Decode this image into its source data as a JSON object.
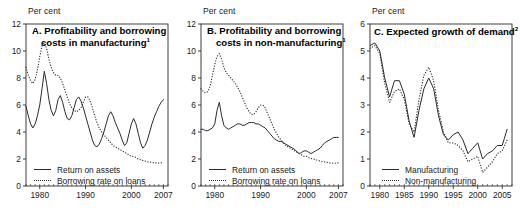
{
  "figure": {
    "unit_label": "Per cent",
    "background": "#ffffff",
    "line_color": "#2b2b2b"
  },
  "panels": [
    {
      "id": "A",
      "title_line1": "A. Profitability and borrowing",
      "title_line2": "costs in manufacturing",
      "title_superscript": "1",
      "unit_label": "Per cent",
      "legend": [
        {
          "label": "Return on assets",
          "style": "solid"
        },
        {
          "label": "Borrowing rate on loans",
          "style": "dotted"
        }
      ],
      "y_ticks": [
        "0",
        "2",
        "4",
        "6",
        "8",
        "10",
        "12"
      ],
      "x_ticks": [
        "1980",
        "1990",
        "2000",
        "2007"
      ]
    },
    {
      "id": "B",
      "title_line1": "B. Profitability and borrowing",
      "title_line2": "costs in non-manufacturing",
      "title_superscript": "1",
      "unit_label": "Per cent",
      "legend": [
        {
          "label": "Return on assets",
          "style": "solid"
        },
        {
          "label": "Borrowing rate on loans",
          "style": "dotted"
        }
      ],
      "y_ticks": [
        "0",
        "2",
        "4",
        "6",
        "8",
        "10",
        "12"
      ],
      "x_ticks": [
        "1980",
        "1990",
        "2000",
        "2007"
      ]
    },
    {
      "id": "C",
      "title_line1": "C. Expected growth of demand",
      "title_line2": "",
      "title_superscript": "2",
      "unit_label": "Per cent",
      "legend": [
        {
          "label": "Manufacturing",
          "style": "solid"
        },
        {
          "label": "Non-manufacturing",
          "style": "dotted"
        }
      ],
      "y_ticks": [
        "0",
        "1",
        "2",
        "3",
        "4",
        "5",
        "6"
      ],
      "x_ticks": [
        "1980",
        "1985",
        "1990",
        "1995",
        "2000",
        "2005"
      ]
    }
  ],
  "chart_data": [
    {
      "type": "line",
      "panel": "A",
      "title": "A. Profitability and borrowing costs in manufacturing",
      "xlabel": "",
      "ylabel": "Per cent",
      "xlim": [
        1977,
        2008
      ],
      "ylim": [
        0,
        12
      ],
      "ytick_step": 2,
      "xticks": [
        1980,
        1990,
        2000,
        2007
      ],
      "grid": false,
      "legend_position": "bottom-left",
      "series": [
        {
          "name": "Return on assets",
          "style": "solid",
          "x": [
            1977,
            1977.5,
            1978,
            1978.5,
            1979,
            1979.5,
            1980,
            1980.5,
            1981,
            1981.5,
            1982,
            1982.5,
            1983,
            1983.5,
            1984,
            1984.5,
            1985,
            1985.5,
            1986,
            1986.5,
            1987,
            1987.5,
            1988,
            1988.5,
            1989,
            1989.5,
            1990,
            1990.5,
            1991,
            1991.5,
            1992,
            1992.5,
            1993,
            1993.5,
            1994,
            1994.5,
            1995,
            1995.5,
            1996,
            1996.5,
            1997,
            1997.5,
            1998,
            1998.5,
            1999,
            1999.5,
            2000,
            2000.5,
            2001,
            2001.5,
            2002,
            2002.5,
            2003,
            2003.5,
            2004,
            2004.5,
            2005,
            2005.5,
            2006,
            2006.5,
            2007
          ],
          "y": [
            5.9,
            5.2,
            4.6,
            4.3,
            4.6,
            5.2,
            6.0,
            7.2,
            8.5,
            7.6,
            6.4,
            5.6,
            5.2,
            5.6,
            6.4,
            6.7,
            6.2,
            5.5,
            5.0,
            4.9,
            5.2,
            5.8,
            6.4,
            6.6,
            6.3,
            5.8,
            5.2,
            4.6,
            4.0,
            3.4,
            3.0,
            2.9,
            3.1,
            3.5,
            4.0,
            4.6,
            5.2,
            5.5,
            5.2,
            4.7,
            4.3,
            3.9,
            3.4,
            3.0,
            3.2,
            3.9,
            4.6,
            5.0,
            4.6,
            3.9,
            3.2,
            2.8,
            3.0,
            3.4,
            4.0,
            4.6,
            5.1,
            5.5,
            5.9,
            6.2,
            6.4
          ]
        },
        {
          "name": "Borrowing rate on loans",
          "style": "dotted",
          "x": [
            1977,
            1977.5,
            1978,
            1978.5,
            1979,
            1979.5,
            1980,
            1980.5,
            1981,
            1981.5,
            1982,
            1982.5,
            1983,
            1983.5,
            1984,
            1984.5,
            1985,
            1985.5,
            1986,
            1986.5,
            1987,
            1987.5,
            1988,
            1988.5,
            1989,
            1989.5,
            1990,
            1990.5,
            1991,
            1991.5,
            1992,
            1992.5,
            1993,
            1993.5,
            1994,
            1994.5,
            1995,
            1995.5,
            1996,
            1996.5,
            1997,
            1997.5,
            1998,
            1998.5,
            1999,
            1999.5,
            2000,
            2000.5,
            2001,
            2001.5,
            2002,
            2002.5,
            2003,
            2003.5,
            2004,
            2004.5,
            2005,
            2005.5,
            2006,
            2006.5,
            2007
          ],
          "y": [
            8.8,
            8.2,
            7.8,
            7.6,
            7.9,
            8.6,
            9.6,
            10.4,
            10.6,
            10.2,
            9.4,
            8.8,
            8.4,
            8.2,
            8.2,
            8.0,
            7.6,
            7.1,
            6.6,
            6.1,
            5.8,
            5.6,
            5.5,
            5.6,
            5.8,
            6.2,
            6.6,
            6.6,
            6.3,
            5.8,
            5.2,
            4.7,
            4.3,
            4.0,
            3.8,
            3.6,
            3.4,
            3.2,
            3.0,
            2.9,
            2.8,
            2.7,
            2.6,
            2.5,
            2.4,
            2.3,
            2.2,
            2.2,
            2.1,
            2.0,
            1.95,
            1.9,
            1.85,
            1.8,
            1.78,
            1.75,
            1.72,
            1.7,
            1.7,
            1.72,
            1.75
          ]
        }
      ]
    },
    {
      "type": "line",
      "panel": "B",
      "title": "B. Profitability and borrowing costs in non-manufacturing",
      "xlabel": "",
      "ylabel": "Per cent",
      "xlim": [
        1977,
        2008
      ],
      "ylim": [
        0,
        12
      ],
      "ytick_step": 2,
      "xticks": [
        1980,
        1990,
        2000,
        2007
      ],
      "grid": false,
      "legend_position": "bottom-left",
      "series": [
        {
          "name": "Return on assets",
          "style": "solid",
          "x": [
            1977,
            1977.5,
            1978,
            1978.5,
            1979,
            1979.5,
            1980,
            1980.5,
            1981,
            1981.5,
            1982,
            1982.5,
            1983,
            1983.5,
            1984,
            1984.5,
            1985,
            1985.5,
            1986,
            1986.5,
            1987,
            1987.5,
            1988,
            1988.5,
            1989,
            1989.5,
            1990,
            1990.5,
            1991,
            1991.5,
            1992,
            1992.5,
            1993,
            1993.5,
            1994,
            1994.5,
            1995,
            1995.5,
            1996,
            1996.5,
            1997,
            1997.5,
            1998,
            1998.5,
            1999,
            1999.5,
            2000,
            2000.5,
            2001,
            2001.5,
            2002,
            2002.5,
            2003,
            2003.5,
            2004,
            2004.5,
            2005,
            2005.5,
            2006,
            2006.5,
            2007
          ],
          "y": [
            4.2,
            4.2,
            4.1,
            4.1,
            4.2,
            4.3,
            4.6,
            5.6,
            6.2,
            5.2,
            4.5,
            4.3,
            4.2,
            4.3,
            4.4,
            4.5,
            4.6,
            4.6,
            4.5,
            4.5,
            4.6,
            4.7,
            4.7,
            4.7,
            4.6,
            4.6,
            4.5,
            4.4,
            4.3,
            4.1,
            3.9,
            3.7,
            3.5,
            3.4,
            3.3,
            3.3,
            3.2,
            3.1,
            3.0,
            2.9,
            2.8,
            2.7,
            2.5,
            2.4,
            2.5,
            2.6,
            2.6,
            2.5,
            2.4,
            2.5,
            2.6,
            2.7,
            2.8,
            3.0,
            3.2,
            3.3,
            3.4,
            3.5,
            3.6,
            3.6,
            3.6
          ]
        },
        {
          "name": "Borrowing rate on loans",
          "style": "dotted",
          "x": [
            1977,
            1977.5,
            1978,
            1978.5,
            1979,
            1979.5,
            1980,
            1980.5,
            1981,
            1981.5,
            1982,
            1982.5,
            1983,
            1983.5,
            1984,
            1984.5,
            1985,
            1985.5,
            1986,
            1986.5,
            1987,
            1987.5,
            1988,
            1988.5,
            1989,
            1989.5,
            1990,
            1990.5,
            1991,
            1991.5,
            1992,
            1992.5,
            1993,
            1993.5,
            1994,
            1994.5,
            1995,
            1995.5,
            1996,
            1996.5,
            1997,
            1997.5,
            1998,
            1998.5,
            1999,
            1999.5,
            2000,
            2000.5,
            2001,
            2001.5,
            2002,
            2002.5,
            2003,
            2003.5,
            2004,
            2004.5,
            2005,
            2005.5,
            2006,
            2006.5,
            2007
          ],
          "y": [
            7.2,
            7.0,
            6.9,
            7.0,
            7.4,
            8.2,
            9.0,
            9.6,
            9.8,
            9.4,
            8.8,
            8.4,
            8.2,
            8.0,
            7.8,
            7.6,
            7.3,
            7.0,
            6.6,
            6.2,
            5.8,
            5.5,
            5.3,
            5.3,
            5.5,
            5.8,
            6.0,
            6.0,
            5.8,
            5.4,
            5.0,
            4.6,
            4.2,
            3.9,
            3.6,
            3.4,
            3.2,
            3.0,
            2.9,
            2.8,
            2.7,
            2.6,
            2.5,
            2.4,
            2.3,
            2.2,
            2.2,
            2.1,
            2.05,
            2.0,
            1.95,
            1.9,
            1.85,
            1.8,
            1.78,
            1.75,
            1.72,
            1.7,
            1.7,
            1.7,
            1.72
          ]
        }
      ]
    },
    {
      "type": "line",
      "panel": "C",
      "title": "C. Expected growth of demand",
      "xlabel": "",
      "ylabel": "Per cent",
      "xlim": [
        1978,
        2007
      ],
      "ylim": [
        0,
        6
      ],
      "ytick_step": 1,
      "xticks": [
        1980,
        1985,
        1990,
        1995,
        2000,
        2005
      ],
      "grid": false,
      "legend_position": "bottom-left",
      "series": [
        {
          "name": "Manufacturing",
          "style": "solid",
          "x": [
            1978,
            1979,
            1980,
            1981,
            1982,
            1983,
            1984,
            1985,
            1986,
            1987,
            1988,
            1989,
            1990,
            1991,
            1992,
            1993,
            1994,
            1995,
            1996,
            1997,
            1998,
            1999,
            2000,
            2001,
            2002,
            2003,
            2004,
            2005,
            2006
          ],
          "y": [
            5.2,
            5.3,
            5.0,
            4.0,
            3.3,
            3.9,
            3.9,
            3.4,
            2.4,
            1.8,
            2.8,
            3.6,
            4.0,
            3.6,
            2.6,
            1.9,
            1.7,
            1.9,
            2.0,
            1.7,
            1.2,
            1.4,
            1.6,
            1.0,
            1.2,
            1.3,
            1.5,
            1.5,
            2.1
          ]
        },
        {
          "name": "Non-manufacturing",
          "style": "dotted",
          "x": [
            1978,
            1979,
            1980,
            1981,
            1982,
            1983,
            1984,
            1985,
            1986,
            1987,
            1988,
            1989,
            1990,
            1991,
            1992,
            1993,
            1994,
            1995,
            1996,
            1997,
            1998,
            1999,
            2000,
            2001,
            2002,
            2003,
            2004,
            2005,
            2006
          ],
          "y": [
            5.1,
            5.2,
            4.9,
            3.8,
            3.1,
            3.5,
            3.6,
            3.2,
            2.3,
            2.0,
            3.2,
            4.1,
            4.4,
            3.9,
            2.8,
            2.0,
            1.6,
            1.6,
            1.5,
            1.3,
            0.9,
            1.0,
            1.1,
            0.5,
            0.7,
            0.9,
            1.2,
            1.3,
            1.7
          ]
        }
      ]
    }
  ]
}
